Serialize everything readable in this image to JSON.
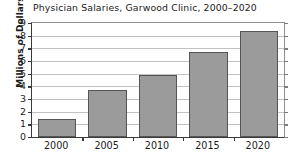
{
  "chart_data": {
    "type": "bar",
    "title": "Physician Salaries, Garwood Clinic, 2000–2020",
    "xlabel": "",
    "ylabel": "Millions of Dollars",
    "categories": [
      "2000",
      "2005",
      "2010",
      "2015",
      "2020"
    ],
    "values": [
      1.4,
      3.7,
      4.9,
      6.75,
      8.4
    ],
    "ylim": [
      0,
      9
    ],
    "ytick_labels": [
      "0",
      "1",
      "2",
      "3",
      "4",
      "5",
      "6",
      "7",
      "8",
      "9"
    ],
    "ytick_values": [
      0,
      1,
      2,
      3,
      4,
      5,
      6,
      7,
      8,
      9
    ],
    "grid": true,
    "legend": null,
    "series": [
      {
        "name": "Physician Salaries",
        "values": [
          1.4,
          3.7,
          4.9,
          6.75,
          8.4
        ]
      }
    ],
    "colors": {
      "bar_fill": "#9b9b9b",
      "bar_edge": "#555555",
      "gridline": "#c2c2c2",
      "axis": "#3a3a3a",
      "text": "#1a1a1a",
      "background": "#ffffff"
    }
  }
}
